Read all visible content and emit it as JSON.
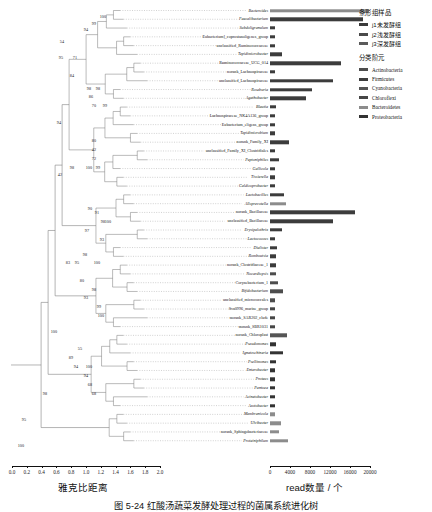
{
  "figure": {
    "caption": "图 5-24  红酸汤蔬菜发酵处理过程的菌属系统进化树",
    "colors": {
      "Actinobacteria": "#4d4d4d",
      "Firmicutes": "#3c3c3c",
      "Cyanobacteria": "#555555",
      "Chloroflexi": "#464646",
      "Bacteroidetes": "#8c8c8c",
      "Proteobacteria": "#333333",
      "branch": "#777777",
      "leader": "#9a9a9a"
    }
  },
  "legends": {
    "sample": {
      "title": "条形组样品",
      "items": [
        {
          "label": "j1未发酵组",
          "color": "#3a3a3a"
        },
        {
          "label": "j2浅发酵组",
          "color": "#4a4a4a"
        },
        {
          "label": "j3深发酵组",
          "color": "#5a5a5a"
        }
      ]
    },
    "taxon": {
      "title": "分类阶元",
      "items": [
        {
          "label": "Actinobacteria",
          "color": "#4d4d4d"
        },
        {
          "label": "Firmicutes",
          "color": "#3c3c3c"
        },
        {
          "label": "Cyanobacteria",
          "color": "#555555"
        },
        {
          "label": "Chloroflexi",
          "color": "#464646"
        },
        {
          "label": "Bacteroidetes",
          "color": "#8c8c8c"
        },
        {
          "label": "Proteobacteria",
          "color": "#333333"
        }
      ]
    }
  },
  "axes": {
    "tree": {
      "title": "雅克比距离",
      "ticks": [
        "0.0",
        "0.2",
        "0.4",
        "0.6",
        "0.8",
        "1.0",
        "1.2",
        "1.4",
        "1.6",
        "1.8",
        "2.0"
      ],
      "min": 0.0,
      "max": 2.0
    },
    "bar": {
      "title": "read数量 / 个",
      "ticks": [
        "0",
        "4000",
        "8000",
        "12000",
        "16000",
        "20000"
      ],
      "min": 0,
      "max": 20000
    }
  },
  "chart_data": {
    "type": "bar",
    "title": "红酸汤蔬菜发酵处理过程的菌属系统进化树",
    "xlabel": "read数量 / 个",
    "ylabel": "",
    "xlim": [
      0,
      20000
    ],
    "grid": false,
    "legend_position": "right",
    "categories": [
      "Bacteroides",
      "Faecalibacterium",
      "Subdoligranulum",
      "Eubacterium]_coprostanoligenes_group",
      "unclassified_Ruminococcaceae",
      "Tepidimicrobacter",
      "Ruminococcaceae_UCG_014",
      "norank_Lachnospiraceae",
      "unclassified_Lachnospiraceae",
      "Roseburia",
      "Agathobacter",
      "Blautia",
      "Lachnospiraceae_NK4A136_group",
      "Eubacterium_eligens_group",
      "Tepidimicrobium",
      "norank_Family_XI",
      "unclassified_Family_XI_Clostridiales",
      "Peptoniphilus",
      "Gallicola",
      "Tissierella",
      "Caldicoprobacter",
      "Lactobacillus",
      "Alloprevotella",
      "norank_Bacillaceae",
      "unclassified_Bacillaceae",
      "Erysipelothrix",
      "Lactococcus",
      "Dialister",
      "Romboutsia",
      "norank_Clostridiaceae_1",
      "Nocardiopsis",
      "Corynebacterium_1",
      "Bifidobacterium",
      "unclassified_micrococcales",
      "Sva0996_marine_group",
      "norank_SAR202_clade",
      "norank_SBR1031",
      "norank_Chloroplast",
      "Pseudomonas",
      "Ignatzschineria",
      "Psellimonas",
      "Enterobacter",
      "Proteus",
      "Pantoea",
      "Acinetobacter",
      "Azotobacter",
      "Membranicola",
      "Ulvibacter",
      "norank_Sphingobacteriaceae",
      "Proteiniphilum"
    ],
    "values": [
      19800,
      18500,
      1050,
      1000,
      1000,
      2400,
      14200,
      900,
      12600,
      8300,
      7200,
      1100,
      1050,
      1000,
      980,
      3800,
      1000,
      1800,
      900,
      1000,
      900,
      2700,
      3100,
      17000,
      12600,
      2300,
      1050,
      1400,
      1250,
      1200,
      1100,
      1500,
      2600,
      900,
      1000,
      950,
      1000,
      3400,
      1100,
      2600,
      1150,
      1000,
      1050,
      1050,
      900,
      900,
      1000,
      2100,
      1800,
      3500
    ],
    "phyla": [
      "Bacteroidetes",
      "Firmicutes",
      "Firmicutes",
      "Firmicutes",
      "Firmicutes",
      "Firmicutes",
      "Firmicutes",
      "Firmicutes",
      "Firmicutes",
      "Firmicutes",
      "Firmicutes",
      "Firmicutes",
      "Firmicutes",
      "Firmicutes",
      "Firmicutes",
      "Firmicutes",
      "Firmicutes",
      "Firmicutes",
      "Firmicutes",
      "Firmicutes",
      "Firmicutes",
      "Firmicutes",
      "Bacteroidetes",
      "Firmicutes",
      "Firmicutes",
      "Firmicutes",
      "Firmicutes",
      "Firmicutes",
      "Firmicutes",
      "Firmicutes",
      "Actinobacteria",
      "Actinobacteria",
      "Actinobacteria",
      "Actinobacteria",
      "Chloroflexi",
      "Chloroflexi",
      "Chloroflexi",
      "Cyanobacteria",
      "Proteobacteria",
      "Proteobacteria",
      "Proteobacteria",
      "Proteobacteria",
      "Proteobacteria",
      "Proteobacteria",
      "Proteobacteria",
      "Proteobacteria",
      "Bacteroidetes",
      "Bacteroidetes",
      "Bacteroidetes",
      "Bacteroidetes"
    ],
    "bootstrap_labels": [
      "100",
      "99",
      "94",
      "54",
      "95",
      "71",
      "84",
      "98",
      "98",
      "86",
      "70",
      "99",
      "94",
      "80",
      "42",
      "72",
      "100",
      "99",
      "42",
      "98",
      "90",
      "91",
      "98",
      "100",
      "97",
      "93",
      "98",
      "95",
      "100",
      "80",
      "98",
      "93",
      "99",
      "100",
      "83",
      "100",
      "55",
      "89",
      "94",
      "100",
      "94",
      "68",
      "68",
      "98",
      "95",
      "100"
    ]
  }
}
